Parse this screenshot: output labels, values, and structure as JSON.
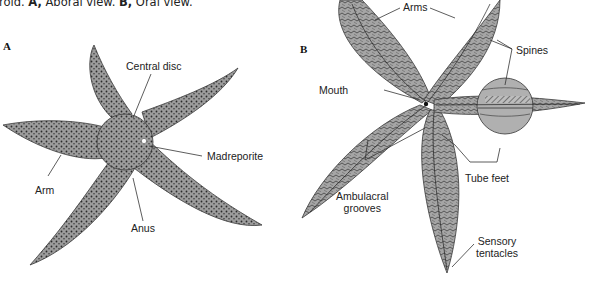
{
  "caption": {
    "prefix": "roid. ",
    "a_label": "A,",
    "a_text": " Aboral view. ",
    "b_label": "B,",
    "b_text": " Oral view."
  },
  "panels": {
    "a": {
      "letter": "A",
      "title": "Aboral view",
      "labels": {
        "central_disc": "Central disc",
        "madreporite": "Madreporite",
        "arm": "Arm",
        "anus": "Anus"
      }
    },
    "b": {
      "letter": "B",
      "title": "Oral view",
      "labels": {
        "arms": "Arms",
        "spines": "Spines",
        "mouth": "Mouth",
        "tube_feet": "Tube feet",
        "ambulacral_1": "Ambulacral",
        "ambulacral_2": "grooves",
        "sensory_1": "Sensory",
        "sensory_2": "tentacles"
      }
    }
  },
  "colors": {
    "body": "#9c9c9c",
    "body_dark": "#6e6e6e",
    "dots": "#2a2a2a",
    "outline": "#3a3a3a",
    "leader": "#333333"
  }
}
